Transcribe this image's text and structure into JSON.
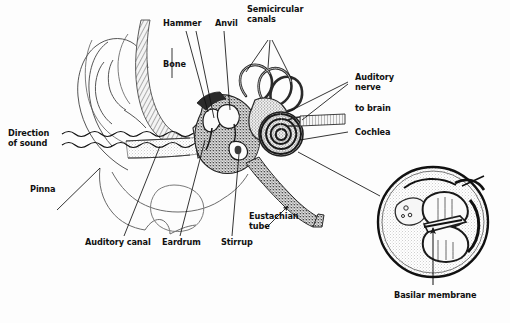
{
  "figure": {
    "type": "labeled-anatomical-diagram",
    "width": 510,
    "height": 323,
    "background_color": "#fdfdfd",
    "ink_color": "#1a1a1a",
    "style": "black-and-white stippled line drawing, cross-section of the ear"
  },
  "labels": {
    "direction_of_sound": "Direction\nof sound",
    "pinna": "Pinna",
    "auditory_canal": "Auditory canal",
    "eardrum": "Eardrum",
    "stirrup": "Stirrup",
    "hammer": "Hammer",
    "anvil": "Anvil",
    "bone": "Bone",
    "semicircular_canals": "Semicircular\ncanals",
    "auditory_nerve": "Auditory\nnerve",
    "to_brain": "to brain",
    "cochlea": "Cochlea",
    "eustachian_tube": "Eustachian\ntube",
    "basilar_membrane": "Basilar membrane"
  },
  "structures": [
    {
      "name": "pinna",
      "label": "Pinna",
      "region": "outer ear"
    },
    {
      "name": "auditory-canal",
      "label": "Auditory canal",
      "region": "outer ear"
    },
    {
      "name": "eardrum",
      "label": "Eardrum",
      "region": "middle ear"
    },
    {
      "name": "hammer",
      "label": "Hammer",
      "region": "middle ear"
    },
    {
      "name": "anvil",
      "label": "Anvil",
      "region": "middle ear"
    },
    {
      "name": "stirrup",
      "label": "Stirrup",
      "region": "middle ear"
    },
    {
      "name": "eustachian-tube",
      "label": "Eustachian tube",
      "region": "middle ear"
    },
    {
      "name": "semicircular-canals",
      "label": "Semicircular canals",
      "region": "inner ear"
    },
    {
      "name": "cochlea",
      "label": "Cochlea",
      "region": "inner ear"
    },
    {
      "name": "auditory-nerve",
      "label": "Auditory nerve",
      "region": "inner ear"
    },
    {
      "name": "basilar-membrane",
      "label": "Basilar membrane",
      "region": "cochlea cross-section"
    },
    {
      "name": "bone",
      "label": "Bone",
      "region": "skull"
    }
  ],
  "inset": {
    "name": "cochlea-cross-section",
    "shape": "circle",
    "callout_label": "Basilar membrane"
  }
}
